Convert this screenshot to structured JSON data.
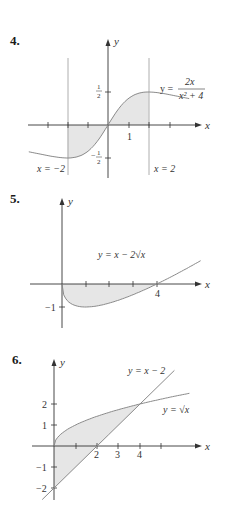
{
  "chart_data": [
    {
      "id": "4",
      "type": "line",
      "title": "4.",
      "xlabel": "x",
      "ylabel": "y",
      "function_label": "y = 2x/(x^2+4)",
      "curve": {
        "formula": "2x/(x^2+4)",
        "x_range": [
          -5,
          5
        ]
      },
      "shaded_region": {
        "between": [
          "y = 2x/(x^2+4)",
          "y = 0"
        ],
        "x_from": -2,
        "x_to": 2
      },
      "vertical_lines": [
        {
          "x": -2,
          "label": "x = −2"
        },
        {
          "x": 2,
          "label": "x = 2"
        }
      ],
      "x_ticks": [
        -3,
        -2,
        -1,
        1,
        2,
        3
      ],
      "x_tick_labels": {
        "1": "1"
      },
      "y_tick_labels": {
        "0.5": "1/2",
        "-0.5": "−1/2"
      },
      "grid": false
    },
    {
      "id": "5",
      "type": "line",
      "title": "5.",
      "xlabel": "x",
      "ylabel": "y",
      "function_label": "y = x − 2√x",
      "curve": {
        "formula": "x - 2*sqrt(x)",
        "x_range": [
          0,
          6
        ]
      },
      "shaded_region": {
        "between": [
          "y = x − 2√x",
          "y = 0"
        ],
        "x_from": 0,
        "x_to": 4
      },
      "x_ticks": [
        1,
        2,
        3,
        4
      ],
      "x_tick_labels": {
        "4": "4"
      },
      "y_tick_labels": {
        "-1": "−1"
      },
      "grid": false
    },
    {
      "id": "6",
      "type": "line",
      "title": "6.",
      "xlabel": "x",
      "ylabel": "y",
      "series": [
        {
          "name": "y = √x",
          "formula": "sqrt(x)",
          "x_range": [
            0,
            6
          ]
        },
        {
          "name": "y = x − 2",
          "formula": "x - 2",
          "x_range": [
            -0.5,
            5.6
          ]
        }
      ],
      "shaded_region": {
        "between": [
          "y = √x",
          "y = x − 2"
        ],
        "x_from": 0,
        "x_to": 4
      },
      "x_ticks": [
        1,
        2,
        3,
        4,
        5
      ],
      "x_tick_labels": {
        "2": "2",
        "3": "3",
        "4": "4"
      },
      "y_tick_labels": {
        "2": "2",
        "1": "1",
        "-1": "−1",
        "-2": "−2"
      },
      "grid": false
    }
  ],
  "labels": {
    "p4": {
      "num": "4.",
      "x": "x",
      "y": "y",
      "one": "1",
      "half_num": "1",
      "half_den": "2",
      "neg": "−",
      "fn_lhs": "y =",
      "fn_num": "2x",
      "fn_den": "x² + 4",
      "vl_left": "x = −2",
      "vl_right": "x = 2"
    },
    "p5": {
      "num": "5.",
      "x": "x",
      "y": "y",
      "four": "4",
      "neg1": "−1",
      "fn": "y = x − 2√x"
    },
    "p6": {
      "num": "6.",
      "x": "x",
      "y": "y",
      "t2": "2",
      "t3": "3",
      "t4": "4",
      "y2": "2",
      "y1": "1",
      "ym1": "−1",
      "ym2": "−2",
      "fn_line": "y = x − 2",
      "fn_sqrt": "y = √x"
    }
  },
  "colors": {
    "axis": "#333333",
    "curve": "#8a8a8a",
    "shade": "#e6e6e6",
    "text": "#222222"
  }
}
